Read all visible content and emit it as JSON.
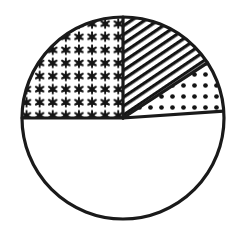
{
  "figure": {
    "title": "",
    "background_color": "#ffffff",
    "outline_color": "#1a1a1a",
    "fill_color": "#ffffff",
    "outline_width": 3.2,
    "circle": {
      "center_x": 123,
      "center_y": 118,
      "radius": 101
    }
  },
  "chart_data": {
    "type": "pie",
    "title": "",
    "subtitle": "",
    "xlabel": "",
    "ylabel": "",
    "grid": false,
    "legend": false,
    "legend_position": "none",
    "units": "fraction of circle",
    "total_degrees": 360,
    "note": "Circle divided into four sectors distinguished by black-and-white fill patterns; no numeric labels are printed on the figure.",
    "categories": [
      "stars",
      "diagonal-hatch",
      "dots",
      "blank"
    ],
    "values": [
      25.0,
      15.8,
      8.1,
      51.1
    ],
    "slices": [
      {
        "name": "stars",
        "pattern": "six-pointed-star-grid",
        "start_angle": 180,
        "end_angle": 270,
        "sweep": 90,
        "percent": 25.0,
        "fraction": "1/4",
        "label": ""
      },
      {
        "name": "diagonal-hatch",
        "pattern": "diagonal-lines-45deg",
        "start_angle": 270,
        "end_angle": 326.9,
        "sweep": 56.9,
        "percent": 15.8,
        "fraction": "",
        "label": ""
      },
      {
        "name": "dots",
        "pattern": "dot-grid",
        "start_angle": 326.9,
        "end_angle": 356.1,
        "sweep": 29.2,
        "percent": 8.1,
        "fraction": "",
        "label": ""
      },
      {
        "name": "blank",
        "pattern": "solid-white",
        "start_angle": 356.1,
        "end_angle": 540,
        "sweep": 183.9,
        "percent": 51.1,
        "fraction": "",
        "label": ""
      }
    ],
    "annotations": []
  }
}
